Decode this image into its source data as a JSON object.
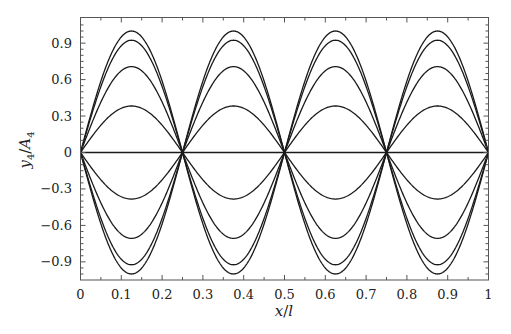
{
  "chart_data": {
    "type": "line",
    "title": "",
    "xlabel": "x/l",
    "ylabel": "y4/A4",
    "ylabel_parts": {
      "y": "y",
      "ysub": "4",
      "sep": "/",
      "A": "A",
      "Asub": "4"
    },
    "xlabel_parts": {
      "x": "x",
      "sep": "/",
      "l": "l"
    },
    "xlim": [
      0,
      1
    ],
    "ylim": [
      -1.08,
      1.08
    ],
    "grid": false,
    "legend": null,
    "xticks": [
      0,
      0.1,
      0.2,
      0.3,
      0.4,
      0.5,
      0.6,
      0.7,
      0.8,
      0.9,
      1
    ],
    "xtick_labels": [
      "0",
      "0.1",
      "0.2",
      "0.3",
      "0.4",
      "0.5",
      "0.6",
      "0.7",
      "0.8",
      "0.9",
      "1"
    ],
    "yticks": [
      0.9,
      0.6,
      0.3,
      0,
      -0.3,
      -0.6,
      -0.9
    ],
    "ytick_labels": [
      "0.9",
      "0.6",
      "0.3",
      "0",
      "−0.3",
      "−0.6",
      "−0.9"
    ],
    "function": "y = a * sin(4*pi*x)",
    "series": [
      {
        "name": "a=1.000",
        "amplitude": 1.0
      },
      {
        "name": "a=0.924",
        "amplitude": 0.924
      },
      {
        "name": "a=0.707",
        "amplitude": 0.707
      },
      {
        "name": "a=0.383",
        "amplitude": 0.383
      },
      {
        "name": "a=0",
        "amplitude": 0.0
      },
      {
        "name": "a=-0.383",
        "amplitude": -0.383
      },
      {
        "name": "a=-0.707",
        "amplitude": -0.707
      },
      {
        "name": "a=-0.924",
        "amplitude": -0.924
      },
      {
        "name": "a=-1.000",
        "amplitude": -1.0
      }
    ],
    "node_positions": [
      0,
      0.25,
      0.5,
      0.75,
      1
    ],
    "antinode_positions": [
      0.125,
      0.375,
      0.625,
      0.875
    ],
    "line_color": "#1a1a1a"
  }
}
